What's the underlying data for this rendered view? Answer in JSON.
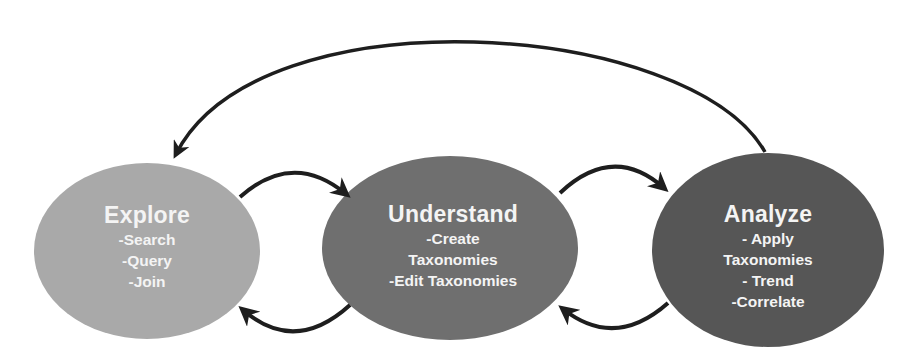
{
  "diagram": {
    "type": "cycle-flow",
    "colors": {
      "explore_fill": "#a9a9a9",
      "understand_fill": "#6f6f6f",
      "analyze_fill": "#565656",
      "arrow": "#1e1e1e",
      "text": "#f4f4f4",
      "background": "#ffffff"
    },
    "nodes": [
      {
        "id": "explore",
        "title": "Explore",
        "items": [
          "-Search",
          "-Query",
          "-Join"
        ]
      },
      {
        "id": "understand",
        "title": "Understand",
        "items": [
          "-Create",
          "Taxonomies",
          "-Edit Taxonomies"
        ]
      },
      {
        "id": "analyze",
        "title": "Analyze",
        "items": [
          "- Apply",
          "Taxonomies",
          "- Trend",
          "-Correlate"
        ]
      }
    ],
    "edges": [
      {
        "from": "explore",
        "to": "understand"
      },
      {
        "from": "understand",
        "to": "explore"
      },
      {
        "from": "understand",
        "to": "analyze"
      },
      {
        "from": "analyze",
        "to": "understand"
      },
      {
        "from": "analyze",
        "to": "explore"
      }
    ]
  }
}
